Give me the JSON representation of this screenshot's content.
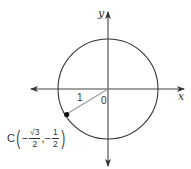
{
  "diagram": {
    "type": "unit-circle",
    "axes": {
      "x_label": "x",
      "y_label": "y",
      "origin_label": "0"
    },
    "radius_label": "1",
    "point": {
      "name": "C",
      "x_num_prefix": "−",
      "x_numerator": "√3",
      "x_denominator": "2",
      "separator": ",",
      "y_num_prefix": "−",
      "y_numerator": "1",
      "y_denominator": "2",
      "angle_degrees": 210
    },
    "colors": {
      "axis": "#333333",
      "circle": "#333333",
      "radius_segment": "#999999",
      "point": "#111111"
    }
  }
}
